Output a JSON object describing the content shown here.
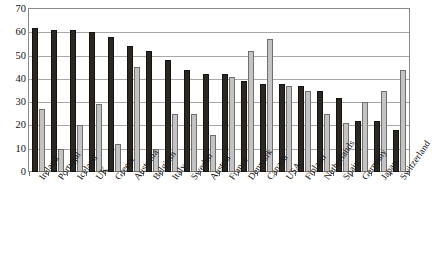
{
  "chart_data": {
    "type": "bar",
    "title": "",
    "xlabel": "",
    "ylabel": "",
    "ylim": [
      0,
      70
    ],
    "ytick_step": 10,
    "yticks": [
      70,
      60,
      50,
      40,
      30,
      20,
      10,
      0
    ],
    "grid": true,
    "legend": "none",
    "orientation": "vertical",
    "grouping": "grouped",
    "categories": [
      "Ireland",
      "Portugal",
      "Iceland",
      "UK",
      "Greece",
      "Australia",
      "Belgium",
      "Italy",
      "Sweden",
      "Austria",
      "France",
      "Denmark",
      "Canada",
      "USA",
      "Finland",
      "Netherlands",
      "Spain",
      "Germany",
      "Japan",
      "Switzerland"
    ],
    "series": [
      {
        "name": "series-dark",
        "color": "#2b2723",
        "values": [
          62,
          61,
          61,
          60,
          58,
          54,
          52,
          48,
          44,
          42,
          42,
          39,
          38,
          38,
          37,
          35,
          32,
          22,
          22,
          18
        ]
      },
      {
        "name": "series-light",
        "color": "#c3c3c3",
        "values": [
          27,
          10,
          20,
          29,
          12,
          45,
          10,
          25,
          25,
          16,
          41,
          52,
          57,
          37,
          35,
          25,
          21,
          30,
          35,
          44
        ]
      }
    ]
  },
  "axis": {
    "y_max_label": "70",
    "y_min_label": "0"
  }
}
